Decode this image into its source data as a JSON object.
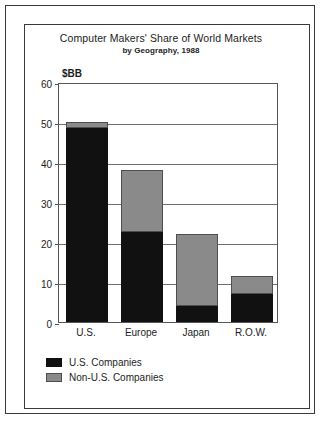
{
  "chart_data": {
    "type": "bar",
    "subtype": "stacked-vertical-bar",
    "title": "Computer Makers' Share of World Markets",
    "subtitle": "by Geography, 1988",
    "xlabel": "",
    "ylabel": "$BB",
    "ylim": [
      0,
      60
    ],
    "ytick_step": 10,
    "ytick_labels": [
      "60",
      "50",
      "40",
      "30",
      "20",
      "10",
      "0"
    ],
    "ytick_values": [
      60,
      50,
      40,
      30,
      20,
      10,
      0
    ],
    "grid": true,
    "grid_axis": "y",
    "legend_position": "below-left",
    "categories": [
      "U.S.",
      "Europe",
      "Japan",
      "R.O.W."
    ],
    "series": [
      {
        "name": "U.S. Companies",
        "color": "#111111",
        "values": [
          48.5,
          22.5,
          4,
          7
        ]
      },
      {
        "name": "Non-U.S. Companies",
        "color": "#8a8a8a",
        "values": [
          1.5,
          15.5,
          18,
          4.5
        ]
      }
    ],
    "totals": [
      50,
      38,
      22,
      11.5
    ]
  },
  "legend": {
    "items": [
      {
        "label": "U.S. Companies",
        "swatch": "black-swatch"
      },
      {
        "label": "Non-U.S. Companies",
        "swatch": "gray-swatch"
      }
    ]
  }
}
